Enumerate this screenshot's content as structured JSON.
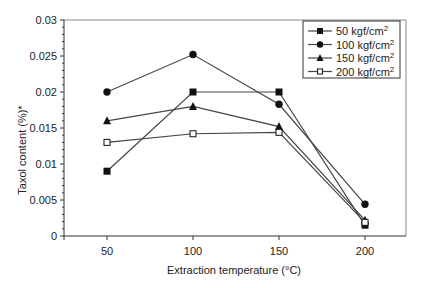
{
  "chart_data": {
    "type": "line",
    "title": "",
    "xlabel": "Extraction temperature (°C)",
    "ylabel": "Taxol content (%)*",
    "x": [
      50,
      100,
      150,
      200
    ],
    "xlim": [
      25,
      225
    ],
    "ylim": [
      0,
      0.03
    ],
    "xticks": [
      "50",
      "100",
      "150",
      "200"
    ],
    "yticks": [
      "0",
      "0.005",
      "0.01",
      "0.015",
      "0.02",
      "0.025",
      "0.03"
    ],
    "grid": false,
    "legend_position": "upper right",
    "series": [
      {
        "name": "50 kgf/cm²",
        "label_main": "50 kgf/cm",
        "label_sup": "2",
        "marker": "filled-square",
        "values": [
          0.009,
          0.02,
          0.02,
          0.0015
        ]
      },
      {
        "name": "100 kgf/cm²",
        "label_main": "100 kgf/cm",
        "label_sup": "2",
        "marker": "filled-circle",
        "values": [
          0.02,
          0.0252,
          0.0183,
          0.0044
        ]
      },
      {
        "name": "150 kgf/cm²",
        "label_main": "150 kgf/cm",
        "label_sup": "2",
        "marker": "filled-triangle",
        "values": [
          0.016,
          0.018,
          0.0152,
          0.0022
        ]
      },
      {
        "name": "200 kgf/cm²",
        "label_main": "200 kgf/cm",
        "label_sup": "2",
        "marker": "open-square",
        "values": [
          0.013,
          0.0142,
          0.0144,
          0.0019
        ]
      }
    ]
  },
  "colors": {
    "line": "#444444",
    "marker": "#111111",
    "axis": "#333333",
    "frame": "#888888"
  }
}
